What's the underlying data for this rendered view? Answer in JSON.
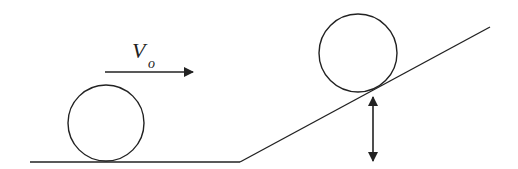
{
  "diagram": {
    "type": "physics-diagram",
    "colors": {
      "stroke": "#222222",
      "background": "#ffffff"
    },
    "velocity_label": {
      "symbol": "V",
      "subscript": "o"
    },
    "ground": {
      "x1": 30,
      "y1": 162,
      "x2": 240,
      "y2": 162
    },
    "incline": {
      "x1": 240,
      "y1": 162,
      "x2": 490,
      "y2": 27
    },
    "ball_start": {
      "cx": 106,
      "cy": 123,
      "r": 38
    },
    "ball_incline": {
      "cx": 358,
      "cy": 53,
      "r": 39
    },
    "velocity_arrow": {
      "x1": 105,
      "y1": 72,
      "x2": 193,
      "y2": 72
    },
    "height_arrow": {
      "x": 373,
      "y1": 97,
      "y2": 161
    }
  }
}
